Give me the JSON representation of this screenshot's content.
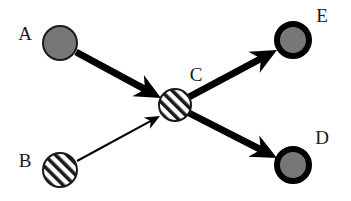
{
  "diagram": {
    "background_color": "#ffffff",
    "width": 351,
    "height": 201,
    "palette": {
      "gray_fill": "#777777",
      "outline": "#1a1a1a",
      "ring": "#000000",
      "hatch_line": "#1a1a1a",
      "hatch_background": "#ffffff",
      "label_color": "#1a1a1a",
      "arrow_color": "#000000"
    },
    "nodes": [
      {
        "id": "A",
        "label": "A",
        "style": "gray-filled",
        "cx": 60,
        "cy": 43,
        "r": 18,
        "ring_width": 2,
        "label_x": 25,
        "label_y": 40
      },
      {
        "id": "B",
        "label": "B",
        "style": "hatched",
        "cx": 60,
        "cy": 170,
        "r": 18,
        "ring_width": 2,
        "label_x": 25,
        "label_y": 167
      },
      {
        "id": "C",
        "label": "C",
        "style": "hatched",
        "cx": 175,
        "cy": 105,
        "r": 17,
        "ring_width": 2,
        "label_x": 196,
        "label_y": 81
      },
      {
        "id": "D",
        "label": "D",
        "style": "gray-thick-ring",
        "cx": 293,
        "cy": 165,
        "r": 19,
        "ring_width": 6,
        "label_x": 322,
        "label_y": 144
      },
      {
        "id": "E",
        "label": "E",
        "style": "gray-thick-ring",
        "cx": 293,
        "cy": 40,
        "r": 19,
        "ring_width": 6,
        "label_x": 322,
        "label_y": 22
      }
    ],
    "edges": [
      {
        "id": "A-to-C",
        "from": "A",
        "to": "C",
        "weight": "thick",
        "shaft_width": 7,
        "head_length": 26,
        "head_width": 24,
        "x1": 76,
        "y1": 52,
        "x2": 161,
        "y2": 98
      },
      {
        "id": "B-to-C",
        "from": "B",
        "to": "C",
        "weight": "thin",
        "shaft_width": 2,
        "head_length": 15,
        "head_width": 13,
        "x1": 77,
        "y1": 161,
        "x2": 160,
        "y2": 116
      },
      {
        "id": "C-to-E",
        "from": "C",
        "to": "E",
        "weight": "thick",
        "shaft_width": 7,
        "head_length": 26,
        "head_width": 24,
        "x1": 189,
        "y1": 97,
        "x2": 277,
        "y2": 50
      },
      {
        "id": "C-to-D",
        "from": "C",
        "to": "D",
        "weight": "thick",
        "shaft_width": 7,
        "head_length": 26,
        "head_width": 24,
        "x1": 189,
        "y1": 113,
        "x2": 277,
        "y2": 158
      }
    ]
  }
}
